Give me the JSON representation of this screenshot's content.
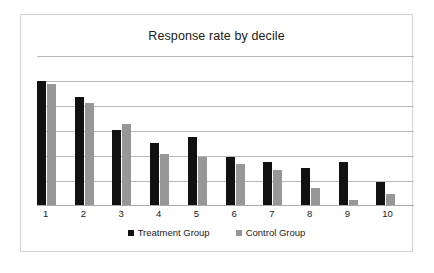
{
  "card": {
    "border_color": "#d2d2d2",
    "background": "#ffffff"
  },
  "chart_data": {
    "type": "bar",
    "title": "Response rate by decile",
    "xlabel": "",
    "ylabel": "",
    "categories": [
      "1",
      "2",
      "3",
      "4",
      "5",
      "6",
      "7",
      "8",
      "9",
      "10"
    ],
    "series": [
      {
        "name": "Treatment Group",
        "color": "#111111",
        "values": [
          5.0,
          4.36,
          3.04,
          2.52,
          2.76,
          1.96,
          1.76,
          1.52,
          1.76,
          0.96
        ]
      },
      {
        "name": "Control Group",
        "color": "#979797",
        "values": [
          4.88,
          4.12,
          3.28,
          2.08,
          1.96,
          1.68,
          1.44,
          0.72,
          0.24,
          0.48
        ]
      }
    ],
    "ylim": [
      0,
      6
    ],
    "grid": true,
    "gridlines": [
      1,
      2,
      3,
      4,
      5,
      6
    ],
    "y_tick_labels_visible": false,
    "legend_position": "bottom",
    "legend": [
      "Treatment Group",
      "Control Group"
    ]
  }
}
